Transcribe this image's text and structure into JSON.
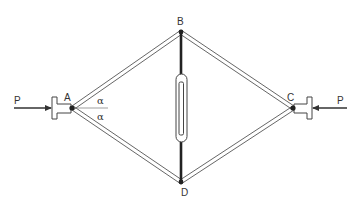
{
  "diagram": {
    "type": "rhombic frame with turnbuckle tie under axial compression",
    "nodes": {
      "A": {
        "label": "A"
      },
      "B": {
        "label": "B"
      },
      "C": {
        "label": "C"
      },
      "D": {
        "label": "D"
      }
    },
    "loads": {
      "left": {
        "label": "P"
      },
      "right": {
        "label": "P"
      }
    },
    "angles": {
      "upper": {
        "label": "α"
      },
      "lower": {
        "label": "α"
      }
    },
    "colors": {
      "line": "#555555",
      "tie": "#222222",
      "background": "#ffffff"
    }
  }
}
